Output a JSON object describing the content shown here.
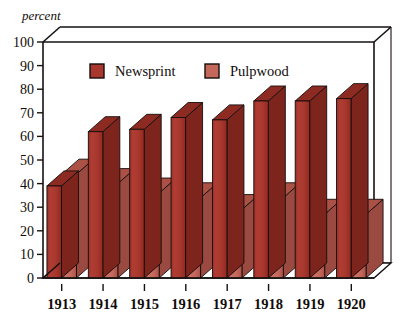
{
  "chart_data": {
    "type": "bar",
    "title": "",
    "subtitle": "",
    "xlabel": "",
    "ylabel": "percent",
    "ylim": [
      0,
      100
    ],
    "ytick_step": 10,
    "yticks": [
      "0",
      "10",
      "20",
      "30",
      "40",
      "50",
      "60",
      "70",
      "80",
      "90",
      "100"
    ],
    "grid": false,
    "three_d": true,
    "legend_position": "top-inside",
    "categories": [
      "1913",
      "1914",
      "1915",
      "1916",
      "1917",
      "1918",
      "1919",
      "1920"
    ],
    "series": [
      {
        "name": "Newsprint",
        "color": "#a8382e",
        "values": [
          39,
          62,
          63,
          68,
          67,
          75,
          75,
          76
        ]
      },
      {
        "name": "Pulpwood",
        "color": "#c4685c",
        "values": [
          44,
          40,
          36,
          34,
          29,
          34,
          27,
          27
        ]
      }
    ]
  },
  "colors": {
    "newsprint_front": "#a8382e",
    "newsprint_top": "#8d2b23",
    "newsprint_side": "#7d241d",
    "pulpwood_front": "#c4685c",
    "pulpwood_top": "#ab5146",
    "pulpwood_side": "#9a4a40",
    "axis": "#151110",
    "background": "#ffffff"
  },
  "legend": {
    "items": [
      {
        "label": "Newsprint",
        "swatch_color": "#a8382e"
      },
      {
        "label": "Pulpwood",
        "swatch_color": "#c4685c"
      }
    ]
  },
  "axis": {
    "y_title": "percent"
  }
}
